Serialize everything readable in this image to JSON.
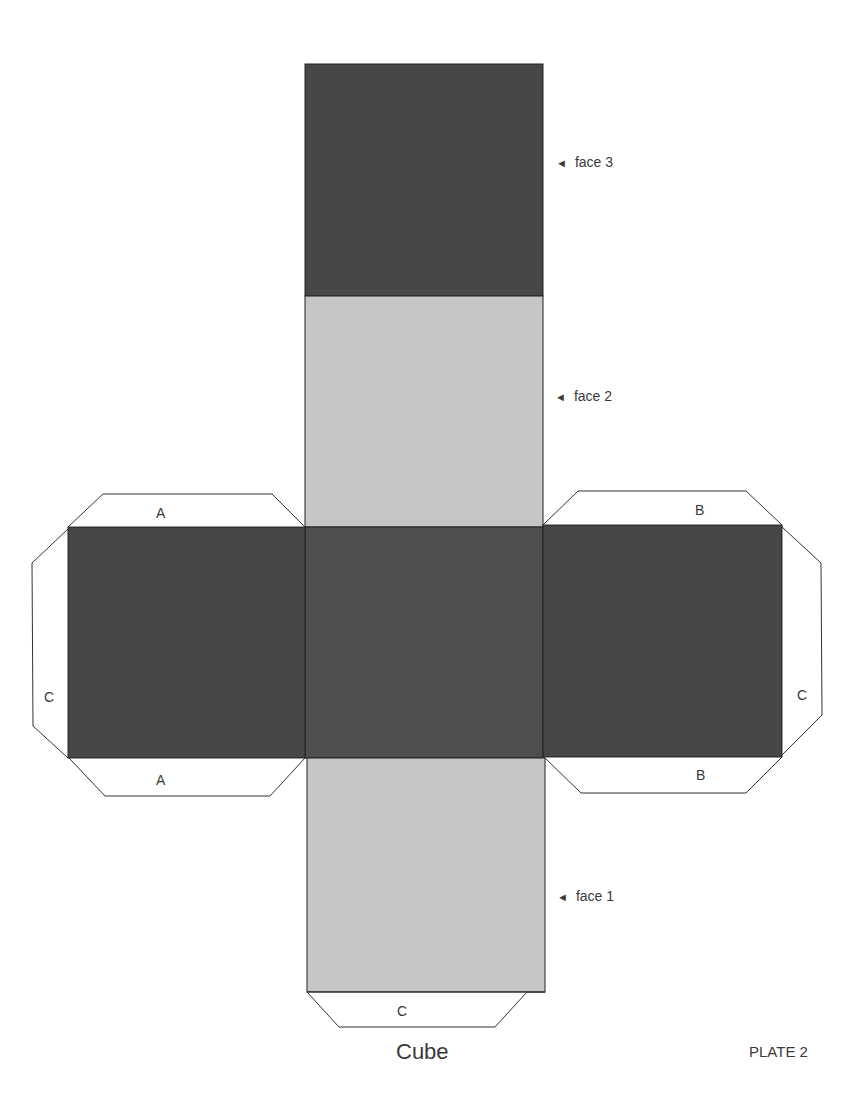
{
  "title": "Cube",
  "plate": "PLATE 2",
  "face_labels": {
    "face3": "face 3",
    "face2": "face 2",
    "face1": "face 1",
    "arrow": "◄"
  },
  "tabs": {
    "left_top": "A",
    "left_bottom": "A",
    "left_side": "C",
    "right_top": "B",
    "right_bottom": "B",
    "right_side": "C",
    "bottom": "C"
  },
  "colors": {
    "dark_face": "#464646",
    "center_face": "#4d4d4d",
    "light_face": "#c4c4c4",
    "outline": "#222222",
    "text": "#3a3a3a"
  }
}
